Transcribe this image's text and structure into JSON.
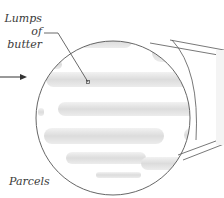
{
  "labels": {
    "lumps_line1": "Lumps",
    "lumps_line2": "of butter",
    "parcels": "Parcels"
  },
  "colors": {
    "outline": "#555555",
    "butter_fill": "#e4e4e4",
    "butter_shade": "#d6d6d6",
    "background": "#ffffff",
    "text": "#3a3a3a"
  },
  "diagram": {
    "magnifier_circle": {
      "cx": 113,
      "cy": 118,
      "r": 77
    },
    "arrow": {
      "x1": 0,
      "y1": 77,
      "x2": 26,
      "y2": 77
    },
    "leader": {
      "from": [
        44,
        33
      ],
      "via": [
        58,
        33
      ],
      "to": [
        88,
        82
      ]
    }
  }
}
